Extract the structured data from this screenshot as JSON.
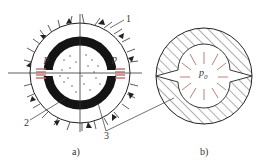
{
  "figure_a": {
    "caption": "a)",
    "labels": {
      "n1": "1",
      "n2": "2",
      "n3": "3",
      "p_left": "p",
      "p_right": "p"
    }
  },
  "figure_b": {
    "caption": "b)",
    "labels": {
      "p0_main": "p",
      "p0_sub": "0"
    }
  },
  "colors": {
    "line": "#2a2a2a",
    "pressure": "#b8706a",
    "ring": "#1a1a1a"
  }
}
